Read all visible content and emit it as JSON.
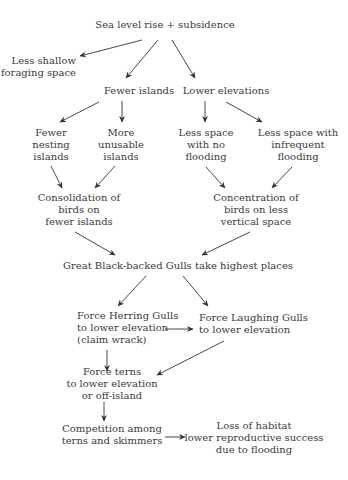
{
  "diagram": {
    "nodes": {
      "root": {
        "lines": [
          "Sea level rise + subsidence"
        ]
      },
      "less_shallow": {
        "lines": [
          "Less shallow",
          "foraging space"
        ]
      },
      "fewer_islands": {
        "lines": [
          "Fewer islands"
        ]
      },
      "lower_elevations": {
        "lines": [
          "Lower elevations"
        ]
      },
      "fewer_nesting": {
        "lines": [
          "Fewer",
          "nesting",
          "islands"
        ]
      },
      "more_unusable": {
        "lines": [
          "More",
          "unusable",
          "islands"
        ]
      },
      "less_space_no_flooding": {
        "lines": [
          "Less space",
          "with no",
          "flooding"
        ]
      },
      "less_space_infrequent": {
        "lines": [
          "Less space with",
          "infrequent",
          "flooding"
        ]
      },
      "consolidation": {
        "lines": [
          "Consolidation of",
          "birds on",
          "fewer islands"
        ]
      },
      "concentration": {
        "lines": [
          "Concentration of",
          "birds on less",
          "vertical space"
        ]
      },
      "great_black_backed": {
        "lines": [
          "Great Black-backed Gulls take highest places"
        ]
      },
      "herring_gulls": {
        "lines": [
          "Force Herring Gulls",
          "to lower elevation",
          "(claim wrack)"
        ]
      },
      "laughing_gulls": {
        "lines": [
          "Force Laughing Gulls",
          "to lower elevation"
        ]
      },
      "terns": {
        "lines": [
          "Force terns",
          "to lower elevation",
          "or off-island"
        ]
      },
      "competition": {
        "lines": [
          "Competition among",
          "terns and skimmers"
        ]
      },
      "loss_of_habitat": {
        "lines": [
          "Loss of habitat",
          "lower reproductive success",
          "due to flooding"
        ]
      }
    },
    "edges": [
      {
        "from": "root",
        "to": "less_shallow"
      },
      {
        "from": "root",
        "to": "fewer_islands"
      },
      {
        "from": "root",
        "to": "lower_elevations"
      },
      {
        "from": "fewer_islands",
        "to": "fewer_nesting"
      },
      {
        "from": "fewer_islands",
        "to": "more_unusable"
      },
      {
        "from": "lower_elevations",
        "to": "less_space_no_flooding"
      },
      {
        "from": "lower_elevations",
        "to": "less_space_infrequent"
      },
      {
        "from": "fewer_nesting",
        "to": "consolidation"
      },
      {
        "from": "more_unusable",
        "to": "consolidation"
      },
      {
        "from": "less_space_no_flooding",
        "to": "concentration"
      },
      {
        "from": "less_space_infrequent",
        "to": "concentration"
      },
      {
        "from": "consolidation",
        "to": "great_black_backed"
      },
      {
        "from": "concentration",
        "to": "great_black_backed"
      },
      {
        "from": "great_black_backed",
        "to": "herring_gulls"
      },
      {
        "from": "great_black_backed",
        "to": "laughing_gulls"
      },
      {
        "from": "herring_gulls",
        "to": "laughing_gulls"
      },
      {
        "from": "herring_gulls",
        "to": "terns"
      },
      {
        "from": "laughing_gulls",
        "to": "terns"
      },
      {
        "from": "terns",
        "to": "competition"
      },
      {
        "from": "competition",
        "to": "loss_of_habitat"
      }
    ],
    "colors": {
      "text": "#3a3a3a",
      "arrow": "#333333",
      "background": "#ffffff"
    }
  }
}
